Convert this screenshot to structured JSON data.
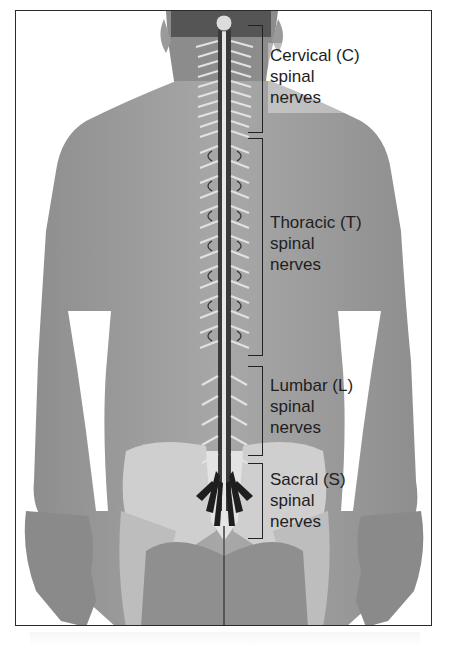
{
  "figure": {
    "colors": {
      "skin": "#9a9a9a",
      "skin_light": "#b5b5b5",
      "pelvis_bone": "#cfcfcf",
      "spine_dark": "#3a3a3a",
      "nerve_light": "#e0e0e0",
      "label_text": "#1e1e1e",
      "frame_border": "#2a2a2a"
    }
  },
  "labels": [
    {
      "region": "Cervical",
      "abbr": "C",
      "line1": "Cervical (C)",
      "line2": "spinal",
      "line3": "nerves"
    },
    {
      "region": "Thoracic",
      "abbr": "T",
      "line1": "Thoracic (T)",
      "line2": "spinal",
      "line3": "nerves"
    },
    {
      "region": "Lumbar",
      "abbr": "L",
      "line1": "Lumbar (L)",
      "line2": "spinal",
      "line3": "nerves"
    },
    {
      "region": "Sacral",
      "abbr": "S",
      "line1": "Sacral (S)",
      "line2": "spinal",
      "line3": "nerves"
    }
  ]
}
